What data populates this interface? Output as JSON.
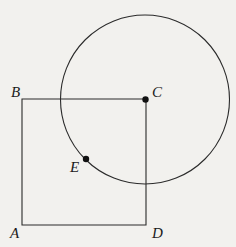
{
  "figure": {
    "kind": "geometry-diagram",
    "background_color": "#f2f1ee",
    "stroke_color": "#2b2b2b",
    "dot_color": "#111111",
    "label_color": "#1b1b1b",
    "canvas": {
      "width": 236,
      "height": 247
    },
    "square": {
      "name": "ABCD",
      "stroke_width": 1.1,
      "vertices": [
        {
          "id": "A",
          "x": 22,
          "y": 225
        },
        {
          "id": "B",
          "x": 22,
          "y": 99
        },
        {
          "id": "C",
          "x": 146,
          "y": 99
        },
        {
          "id": "D",
          "x": 146,
          "y": 225
        }
      ],
      "path": "M 22 99 L 146 99 L 146 225 L 22 225 Z"
    },
    "circle": {
      "center_label": "C",
      "cx": 145,
      "cy": 99.5,
      "r": 84.5,
      "stroke_width": 1.1
    },
    "points": [
      {
        "id": "C",
        "x": 145.5,
        "y": 99.5,
        "radius": 3.2
      },
      {
        "id": "E",
        "x": 86,
        "y": 159,
        "radius": 3.2
      }
    ],
    "labels": [
      {
        "id": "label-A",
        "text": "A",
        "left": 10,
        "top": 226
      },
      {
        "id": "label-B",
        "text": "B",
        "left": 11,
        "top": 85
      },
      {
        "id": "label-C",
        "text": "C",
        "left": 152,
        "top": 85
      },
      {
        "id": "label-D",
        "text": "D",
        "left": 152,
        "top": 226
      },
      {
        "id": "label-E",
        "text": "E",
        "left": 70,
        "top": 160
      }
    ]
  }
}
